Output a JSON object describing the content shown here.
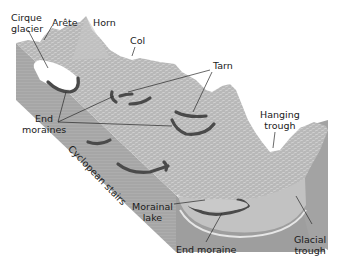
{
  "diagram": {
    "colors": {
      "terrain": "#b4b4b4",
      "terrain_light": "#cdcdcd",
      "side_face": "#a5a5a5",
      "front_face": "#9c9c9c",
      "moraine": "#4a4a4a",
      "ice": "#ffffff",
      "leader": "#2a2a2a"
    },
    "labels": {
      "cirque_glacier": [
        "Cirque",
        "glacier"
      ],
      "arete": "Arête",
      "horn": "Horn",
      "col": "Col",
      "tarn": "Tarn",
      "end_moraines": [
        "End",
        "moraines"
      ],
      "hanging_trough": [
        "Hanging",
        "trough"
      ],
      "cyclopean_stairs": "Cyclopean stairs",
      "morainal_lake": [
        "Morainal",
        "lake"
      ],
      "end_moraine": "End moraine",
      "glacial_trough": [
        "Glacial",
        "trough"
      ]
    }
  }
}
